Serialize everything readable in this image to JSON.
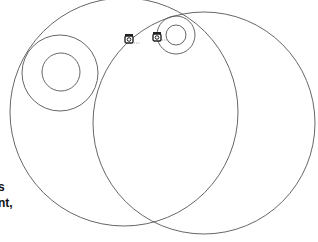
{
  "diagram": {
    "type": "orbit-circles",
    "background": "#ffffff",
    "stroke_color": "#555555",
    "circles": [
      {
        "id": "large-left-orbit",
        "cx": 124,
        "cy": 112,
        "r": 114
      },
      {
        "id": "large-right-orbit",
        "cx": 204,
        "cy": 123,
        "r": 111
      },
      {
        "id": "left-outer-ring",
        "cx": 60,
        "cy": 73,
        "r": 38
      },
      {
        "id": "left-inner-ring",
        "cx": 61,
        "cy": 72,
        "r": 19
      },
      {
        "id": "top-outer-ring",
        "cx": 176,
        "cy": 35,
        "r": 19
      },
      {
        "id": "top-inner-ring",
        "cx": 176,
        "cy": 35,
        "r": 10
      }
    ],
    "nodes": [
      {
        "id": "node-1",
        "icon": "camera-icon",
        "x": 129,
        "y": 39,
        "label": "..."
      },
      {
        "id": "node-2",
        "icon": "camera-icon",
        "x": 157,
        "y": 37,
        "label": "..."
      }
    ],
    "edge_text": {
      "line1": "s",
      "line2": "nt,"
    }
  }
}
